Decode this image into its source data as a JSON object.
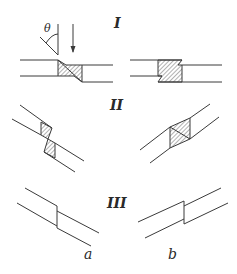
{
  "figure": {
    "rows": [
      {
        "label": "I",
        "description": "vertical-loaded joint with stepped shaded overlap"
      },
      {
        "label": "II",
        "description": "inclined pipes with shaded stepped joint"
      },
      {
        "label": "III",
        "description": "inclined pipes with stepped offset joint, no shading"
      }
    ],
    "columns": [
      {
        "label": "a"
      },
      {
        "label": "b"
      }
    ],
    "annotations": {
      "angle_symbol": "θ",
      "arrow": "downward load arrow"
    },
    "colors": {
      "line": "#3a3a3a",
      "hatch": "#555555",
      "background": "#ffffff"
    }
  }
}
